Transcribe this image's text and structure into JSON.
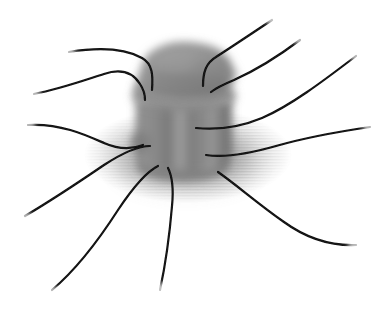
{
  "figure": {
    "title": "Blurred grayscale rendering of a barrel-shaped macromolecular complex anchored in a striped membrane disk with radiating filaments",
    "background_color": "#ffffff",
    "width": 386,
    "height": 313,
    "style": "grayscale volumetric blur illustration"
  },
  "palette": {
    "background": "#ffffff",
    "complex_body": "#8a8a8a",
    "complex_body_dark": "#6f6f6f",
    "complex_cap": "#8e8e8e",
    "complex_shadow": "#5f5f5f",
    "complex_highlight": "#b4b4b4",
    "membrane_haze": "#bdbdbd",
    "membrane_stripe": "#9a9a9a",
    "filament": "#121212"
  },
  "components": {
    "cap": {
      "name": "Top cap domain",
      "center_x": 186,
      "center_y": 70,
      "radius_x": 48,
      "radius_y": 28,
      "blur": 4,
      "fill": "#8e8e8e"
    },
    "collar": {
      "name": "Collar ring",
      "center_x": 184,
      "center_y": 94,
      "radius_x": 52,
      "radius_y": 14,
      "blur": 4,
      "fill": "#8a8a8a"
    },
    "body": {
      "name": "Cylindrical barrel body",
      "center_x": 184,
      "center_y": 130,
      "width": 96,
      "height": 78,
      "blur": 4,
      "fill": "#858585",
      "subunit_count": 6
    },
    "base": {
      "name": "Basal foot",
      "center_x": 183,
      "center_y": 166,
      "radius_x": 46,
      "radius_y": 14,
      "blur": 4,
      "fill": "#7c7c7c"
    },
    "membrane": {
      "name": "Striped membrane haze disk",
      "center_x": 188,
      "center_y": 155,
      "radius_x": 104,
      "radius_y": 48,
      "blur": 11,
      "stripe_spacing": 3,
      "stripe_color": "#9a9a9a",
      "base_color": "#c6c6c6"
    }
  },
  "filaments": {
    "count": 9,
    "stroke_color": "#121212",
    "stroke_width": 2.2,
    "tapered_ends": true,
    "paths": [
      {
        "id": "filament-upper-left-1",
        "label": "Upper left filament",
        "d": "M 69 52 C 100 47 124 48 142 58 C 153 64 153 76 152 90"
      },
      {
        "id": "filament-upper-left-2",
        "label": "Second upper left filament",
        "d": "M 34 94 C 60 89 85 80 104 74 C 122 68 133 73 140 84 C 144 90 145 95 145 100"
      },
      {
        "id": "filament-left-middle",
        "label": "Left middle filament",
        "d": "M 28 125 C 60 123 86 135 104 143 C 120 150 133 149 143 145"
      },
      {
        "id": "filament-left-lower",
        "label": "Lower left descending filament",
        "d": "M 25 216 C 52 200 82 180 104 165 C 124 152 139 146 150 146"
      },
      {
        "id": "filament-bottom-left",
        "label": "Bottom left descending filament",
        "d": "M 52 290 C 78 268 100 238 118 210 C 134 186 146 172 158 166"
      },
      {
        "id": "filament-top-right-1",
        "label": "Top right filament",
        "d": "M 272 20 C 248 36 230 48 216 57 C 206 63 203 72 203 86"
      },
      {
        "id": "filament-top-right-2",
        "label": "Second top right filament",
        "d": "M 300 40 C 276 58 252 72 234 80 C 222 85 216 88 211 92"
      },
      {
        "id": "filament-right",
        "label": "Right horizontal filament",
        "d": "M 356 56 C 322 82 290 106 262 118 C 238 128 216 130 196 128"
      },
      {
        "id": "filament-right-lower",
        "label": "Right lower sweeping filament",
        "d": "M 370 127 C 336 132 304 138 276 146 C 248 154 226 158 206 155"
      },
      {
        "id": "filament-bottom-right",
        "label": "Bottom right descending filament",
        "d": "M 356 245 C 330 246 306 238 284 222 C 258 204 238 186 218 172"
      },
      {
        "id": "filament-bottom-center",
        "label": "Bottom center descending filament",
        "d": "M 160 290 C 166 262 170 230 172 206 C 174 186 172 176 168 168"
      }
    ]
  }
}
